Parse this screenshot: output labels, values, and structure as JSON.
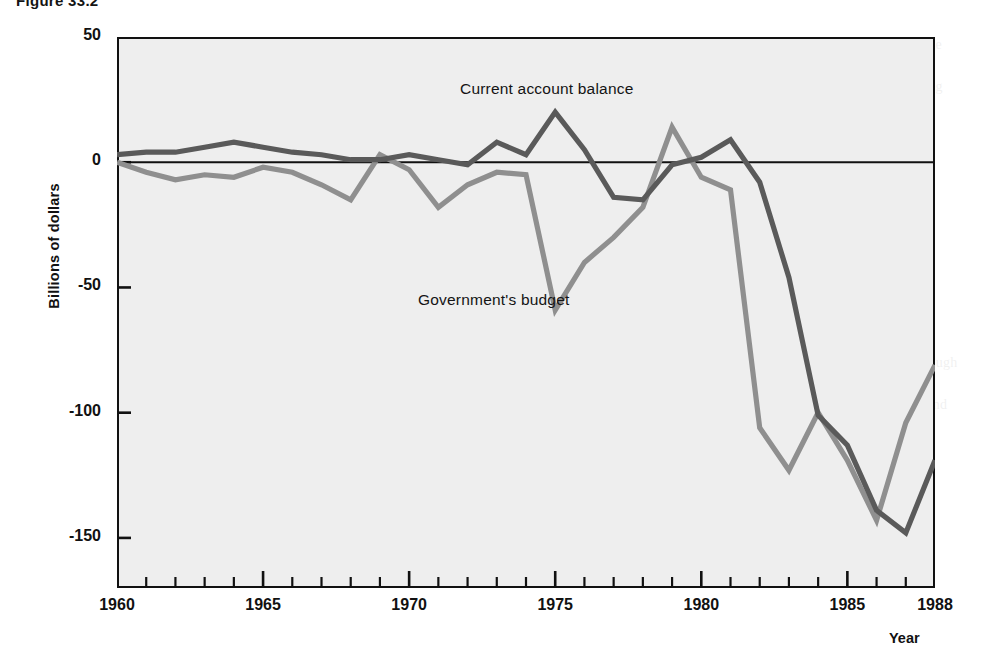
{
  "figure": {
    "caption": "Figure 33.2"
  },
  "axes": {
    "y_title": "Billions of dollars",
    "x_title": "Year",
    "y_ticks": [
      {
        "value": 50,
        "label": "50"
      },
      {
        "value": 0,
        "label": "0"
      },
      {
        "value": -50,
        "label": "-50"
      },
      {
        "value": -100,
        "label": "-100"
      },
      {
        "value": -150,
        "label": "-150"
      }
    ],
    "x_ticks": [
      {
        "value": 1960,
        "label": "1960"
      },
      {
        "value": 1965,
        "label": "1965"
      },
      {
        "value": 1970,
        "label": "1970"
      },
      {
        "value": 1975,
        "label": "1975"
      },
      {
        "value": 1980,
        "label": "1980"
      },
      {
        "value": 1985,
        "label": "1985"
      },
      {
        "value": 1988,
        "label": "1988"
      }
    ]
  },
  "annotations": {
    "current_account_label": "Current account balance",
    "budget_label": "Government's budget"
  },
  "colors": {
    "plot_background": "#eeeeee",
    "frame": "#111111",
    "zero_line": "#111111",
    "current_account_line": "#5a5a5a",
    "budget_line": "#8f8f8f",
    "page_background": "#ffffff"
  },
  "bleed_text": {
    "left_top": "was slower and less complete than in the previous expansion. The current account balance fell sharply in the 1980s while the government's budget deficit widened, and the two series moved together through much of that decade.",
    "left_bottom": "countries. A current account deficit means that a nation is borrowing from the rest of the world, and so it must either sell assets or incur debt to finance the gap between its spending and its income during that period.",
    "right_top": "balance of the 1980s was unprecedented in the postwar era, and it coincided with an equally unprecedented federal budget deficit, a pairing that economists labelled the twin deficits.",
    "right_bottom": "Deficits and the exchange rate are linked through the interest rate. When the deficit increases, interest rates rise, the currency appreciates, and the current account balance deteriorates."
  },
  "chart_data": {
    "type": "line",
    "title": "Figure 33.2",
    "xlabel": "Year",
    "ylabel": "Billions of dollars",
    "xlim": [
      1960,
      1988
    ],
    "ylim": [
      -170,
      50
    ],
    "grid": false,
    "legend": "inline-annotations",
    "x": [
      1960,
      1961,
      1962,
      1963,
      1964,
      1965,
      1966,
      1967,
      1968,
      1969,
      1970,
      1971,
      1972,
      1973,
      1974,
      1975,
      1976,
      1977,
      1978,
      1979,
      1980,
      1981,
      1982,
      1983,
      1984,
      1985,
      1986,
      1987,
      1988
    ],
    "series": [
      {
        "name": "Current account balance",
        "color": "#5a5a5a",
        "values": [
          3,
          4,
          4,
          5,
          7,
          6,
          4,
          3,
          1,
          1,
          2,
          -2,
          -6,
          7,
          2,
          18,
          4,
          -14,
          -15,
          -1,
          2,
          5,
          -8,
          -46,
          -107,
          -115,
          -139,
          -144,
          -127
        ]
      },
      {
        "name": "Government's budget",
        "color": "#8f8f8f",
        "values": [
          0,
          -3,
          -7,
          -5,
          -6,
          -2,
          -4,
          -9,
          -12,
          3,
          -3,
          -17,
          -8,
          -6,
          -5,
          -59,
          -40,
          -32,
          -24,
          -15,
          -7,
          13,
          6,
          -20,
          -24,
          -1,
          -16,
          -14,
          -3
        ]
      }
    ],
    "series_actual": [
      {
        "name": "Current account balance",
        "color": "#5a5a5a",
        "points": [
          {
            "x": 1960,
            "y": 3
          },
          {
            "x": 1961,
            "y": 4
          },
          {
            "x": 1962,
            "y": 4
          },
          {
            "x": 1963,
            "y": 6
          },
          {
            "x": 1964,
            "y": 8
          },
          {
            "x": 1965,
            "y": 6
          },
          {
            "x": 1966,
            "y": 4
          },
          {
            "x": 1967,
            "y": 3
          },
          {
            "x": 1968,
            "y": 1
          },
          {
            "x": 1969,
            "y": 1
          },
          {
            "x": 1970,
            "y": 3
          },
          {
            "x": 1971,
            "y": 1
          },
          {
            "x": 1972,
            "y": -1
          },
          {
            "x": 1973,
            "y": 8
          },
          {
            "x": 1974,
            "y": 3
          },
          {
            "x": 1975,
            "y": 20
          },
          {
            "x": 1976,
            "y": 5
          },
          {
            "x": 1977,
            "y": -14
          },
          {
            "x": 1978,
            "y": -15
          },
          {
            "x": 1979,
            "y": -1
          },
          {
            "x": 1980,
            "y": 2
          },
          {
            "x": 1981,
            "y": 9
          },
          {
            "x": 1982,
            "y": -8
          },
          {
            "x": 1983,
            "y": -46
          },
          {
            "x": 1984,
            "y": -101
          },
          {
            "x": 1985,
            "y": -113
          },
          {
            "x": 1986,
            "y": -139
          },
          {
            "x": 1987,
            "y": -148
          },
          {
            "x": 1988,
            "y": -119
          }
        ]
      },
      {
        "name": "Government's budget",
        "color": "#8f8f8f",
        "points": [
          {
            "x": 1960,
            "y": 0
          },
          {
            "x": 1961,
            "y": -4
          },
          {
            "x": 1962,
            "y": -7
          },
          {
            "x": 1963,
            "y": -5
          },
          {
            "x": 1964,
            "y": -6
          },
          {
            "x": 1965,
            "y": -2
          },
          {
            "x": 1966,
            "y": -4
          },
          {
            "x": 1967,
            "y": -9
          },
          {
            "x": 1968,
            "y": -15
          },
          {
            "x": 1969,
            "y": 3
          },
          {
            "x": 1970,
            "y": -3
          },
          {
            "x": 1971,
            "y": -18
          },
          {
            "x": 1972,
            "y": -9
          },
          {
            "x": 1973,
            "y": -4
          },
          {
            "x": 1974,
            "y": -5
          },
          {
            "x": 1975,
            "y": -59
          },
          {
            "x": 1976,
            "y": -40
          },
          {
            "x": 1977,
            "y": -30
          },
          {
            "x": 1978,
            "y": -18
          },
          {
            "x": 1979,
            "y": 14
          },
          {
            "x": 1980,
            "y": -6
          },
          {
            "x": 1981,
            "y": -11
          },
          {
            "x": 1982,
            "y": -106
          },
          {
            "x": 1983,
            "y": -123
          },
          {
            "x": 1984,
            "y": -100
          },
          {
            "x": 1985,
            "y": -119
          },
          {
            "x": 1986,
            "y": -143
          },
          {
            "x": 1987,
            "y": -104
          },
          {
            "x": 1988,
            "y": -81
          }
        ]
      }
    ]
  }
}
